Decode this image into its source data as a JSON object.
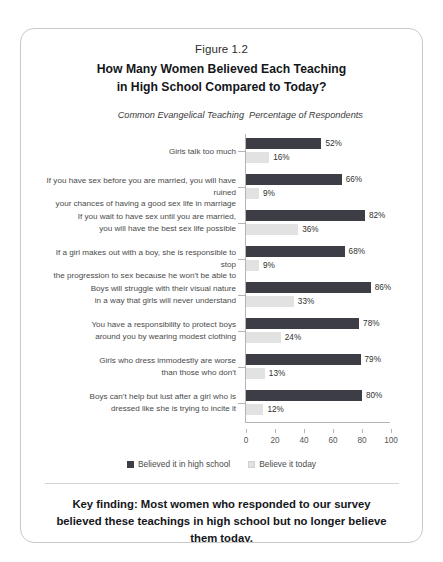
{
  "figure": {
    "number": "Figure 1.2",
    "title": "How Many Women Believed Each Teaching\nin High School Compared to Today?",
    "title_line1": "How Many Women Believed Each Teaching",
    "title_line2": "in High School Compared to Today?"
  },
  "columns": {
    "teaching_header": "Common Evangelical Teaching",
    "percent_header": "Percentage of Respondents"
  },
  "legend": {
    "then_label": "Believed it in high school",
    "now_label": "Believe it today"
  },
  "colors": {
    "then_bar": "#3d3d45",
    "now_bar": "#e2e2e2",
    "axis": "#b4b4b4",
    "border": "#c9c9c9",
    "text": "#14161a"
  },
  "key_finding": "Key finding: Most women who responded to our survey believed these teachings in high school but no longer believe them today.",
  "chart_data": {
    "type": "bar",
    "orientation": "horizontal",
    "title": "How Many Women Believed Each Teaching in High School Compared to Today?",
    "xlabel": "Percentage of Respondents",
    "ylabel": "Common Evangelical Teaching",
    "xlim": [
      0,
      100
    ],
    "xticks": [
      0,
      20,
      40,
      60,
      80,
      100
    ],
    "grid": false,
    "legend_position": "bottom",
    "value_suffix": "%",
    "categories": [
      "Girls talk too much",
      "If you have sex before you are married, you will have ruined your chances of having a good sex life in marriage",
      "If you wait to have sex until you are married, you will have the best sex life possible",
      "If a girl makes out with a boy, she is responsible to stop the progression to sex because he won't be able to",
      "Boys will struggle with their visual nature in a way that girls will never understand",
      "You have a responsibility to protect boys around you by wearing modest clothing",
      "Girls who dress immodestly are worse than those who don't",
      "Boys can't help but lust after a girl who is dressed like she is trying to incite it"
    ],
    "category_lines": [
      [
        "Girls talk too much"
      ],
      [
        "If you have sex before you are married, you will have ruined",
        "your chances of having a good sex life in marriage"
      ],
      [
        "If you wait to have sex until you are married,",
        "you will have the best sex life possible"
      ],
      [
        "If a girl makes out with a boy, she is responsible to stop",
        "the progression to sex because he won't be able to"
      ],
      [
        "Boys will struggle with their visual nature",
        "in a way that girls will never understand"
      ],
      [
        "You have a responsibility to protect boys",
        "around you by wearing modest clothing"
      ],
      [
        "Girls who dress immodestly are worse",
        "than those who don't"
      ],
      [
        "Boys can't help but lust after a girl who is",
        "dressed like she is trying to incite it"
      ]
    ],
    "series": [
      {
        "name": "Believed it in high school",
        "color": "#3d3d45",
        "values": [
          52,
          66,
          82,
          68,
          86,
          78,
          79,
          80
        ],
        "labels": [
          "52%",
          "66%",
          "82%",
          "68%",
          "86%",
          "78%",
          "79%",
          "80%"
        ]
      },
      {
        "name": "Believe it today",
        "color": "#e2e2e2",
        "values": [
          16,
          9,
          36,
          9,
          33,
          24,
          13,
          12
        ],
        "labels": [
          "16%",
          "9%",
          "36%",
          "9%",
          "33%",
          "24%",
          "13%",
          "12%"
        ]
      }
    ]
  }
}
